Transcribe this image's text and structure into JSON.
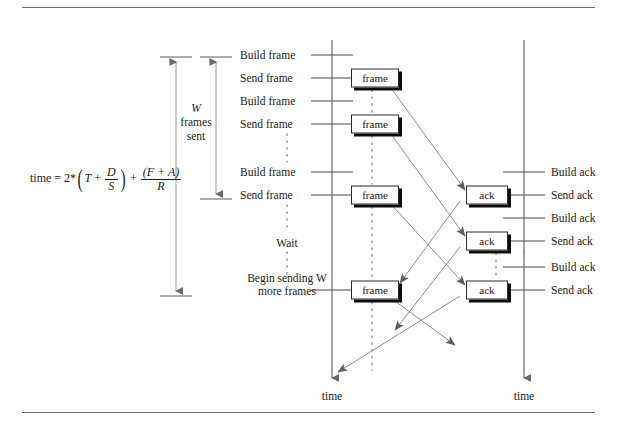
{
  "figure": {
    "colors": {
      "rule": "#6e6e6e",
      "timeline": "#6b6b6b",
      "arrow": "#7a7a7a",
      "box_border": "#2b2b2b",
      "box_shadow": "#0d0d0d",
      "text": "#1a1a1a",
      "dotted": "#8a8a8a"
    }
  },
  "formula": {
    "lhs": "time",
    "equals": "=",
    "coefficient": "2*",
    "term_T": "T",
    "plus_1": "+",
    "frac1_num": "D",
    "frac1_den": "S",
    "plus_2": "+",
    "frac2_num": "(F + A)",
    "frac2_den": "R",
    "paren_open": "(",
    "paren_close": ")"
  },
  "measures": {
    "total_time_label": "",
    "window_caption": {
      "line1": "W",
      "line2": "frames",
      "line3": "sent"
    }
  },
  "sender": {
    "axis_label": "time",
    "events": [
      {
        "label": "Build frame",
        "y": 55
      },
      {
        "label": "Send frame",
        "y": 78
      },
      {
        "label": "Build frame",
        "y": 101
      },
      {
        "label": "Send frame",
        "y": 124
      },
      {
        "label": "Build frame",
        "y": 172
      },
      {
        "label": "Send frame",
        "y": 195
      }
    ],
    "wait_label": "Wait",
    "resume_label_line1": "Begin sending W",
    "resume_label_line2": "more frames",
    "resume_y": 290
  },
  "receiver": {
    "axis_label": "time",
    "events": [
      {
        "label": "Build ack",
        "y": 172
      },
      {
        "label": "Send ack",
        "y": 195
      },
      {
        "label": "Build ack",
        "y": 218
      },
      {
        "label": "Send ack",
        "y": 241
      },
      {
        "label": "Build ack",
        "y": 267
      },
      {
        "label": "Send ack",
        "y": 290
      }
    ]
  },
  "messages": {
    "frame_label": "frame",
    "ack_label": "ack",
    "frames": [
      {
        "label": "frame",
        "y": 78
      },
      {
        "label": "frame",
        "y": 124
      },
      {
        "label": "frame",
        "y": 195
      },
      {
        "label": "frame",
        "y": 290
      }
    ],
    "acks": [
      {
        "label": "ack",
        "y": 195
      },
      {
        "label": "ack",
        "y": 241
      },
      {
        "label": "ack",
        "y": 290
      }
    ]
  }
}
